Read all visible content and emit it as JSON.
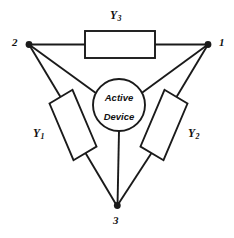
{
  "figure": {
    "kind": "circuit-schematic",
    "background_color": "#ffffff",
    "line_color": "#1a1a1a"
  },
  "nodes": [
    {
      "id": "node-1",
      "label": "1",
      "x": 208,
      "y": 44,
      "label_x": 219,
      "label_y": 38
    },
    {
      "id": "node-2",
      "label": "2",
      "x": 29,
      "y": 44,
      "label_x": 12,
      "label_y": 38
    },
    {
      "id": "node-3",
      "label": "3",
      "x": 117,
      "y": 206,
      "label_x": 113,
      "label_y": 216
    }
  ],
  "components": [
    {
      "id": "y1",
      "label": "Y",
      "subscript": "1",
      "label_x": 33,
      "label_y": 128,
      "orientation": "tilted-left-leg"
    },
    {
      "id": "y2",
      "label": "Y",
      "subscript": "2",
      "label_x": 188,
      "label_y": 128,
      "orientation": "tilted-right-leg"
    },
    {
      "id": "y3",
      "label": "Y",
      "subscript": "3",
      "label_x": 110,
      "label_y": 10,
      "orientation": "horizontal-top"
    }
  ],
  "active_device": {
    "line_1": "Active",
    "line_2": "Device",
    "center_x": 119,
    "center_y": 105,
    "radius": 26
  }
}
